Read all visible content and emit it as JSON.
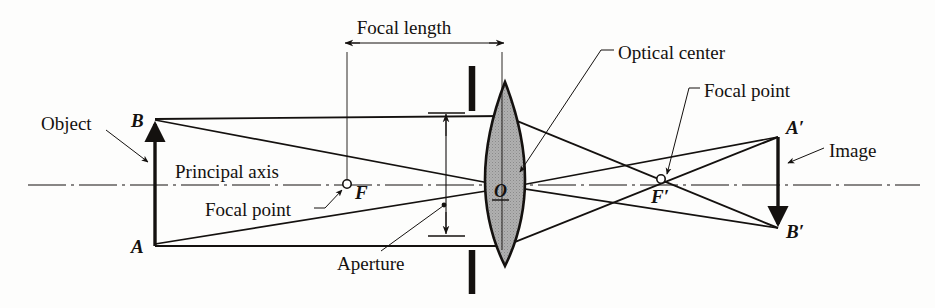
{
  "figure": {
    "background_color": "#fdfdfc",
    "ink_color": "#14110f",
    "lens_fill_color": "#a5a5a5"
  },
  "labels": {
    "focal_length": "Focal length",
    "optical_center": "Optical center",
    "focal_point_right": "Focal point",
    "focal_point_left": "Focal point",
    "object": "Object",
    "image": "Image",
    "principal_axis": "Principal axis",
    "aperture": "Aperture"
  },
  "points": {
    "b": "B",
    "a": "A",
    "f": "F",
    "o": "O",
    "f_prime": "F′",
    "a_prime": "A′",
    "b_prime": "B′"
  },
  "geometry": {
    "principal_axis_y": 185,
    "object_x": 155,
    "object_top_y": 120,
    "object_bottom_y": 246,
    "lens_center_x": 505,
    "lens_top_y": 82,
    "lens_bottom_y": 266,
    "focal_point_left_x": 347,
    "focal_point_right_x": 661,
    "image_x": 778,
    "image_top_y": 137,
    "image_bottom_y": 228,
    "aperture_line_x": 446,
    "aperture_top_y": 113,
    "aperture_bottom_y": 233,
    "stop_bar_x": 472,
    "focal_length_dim_y": 43
  }
}
